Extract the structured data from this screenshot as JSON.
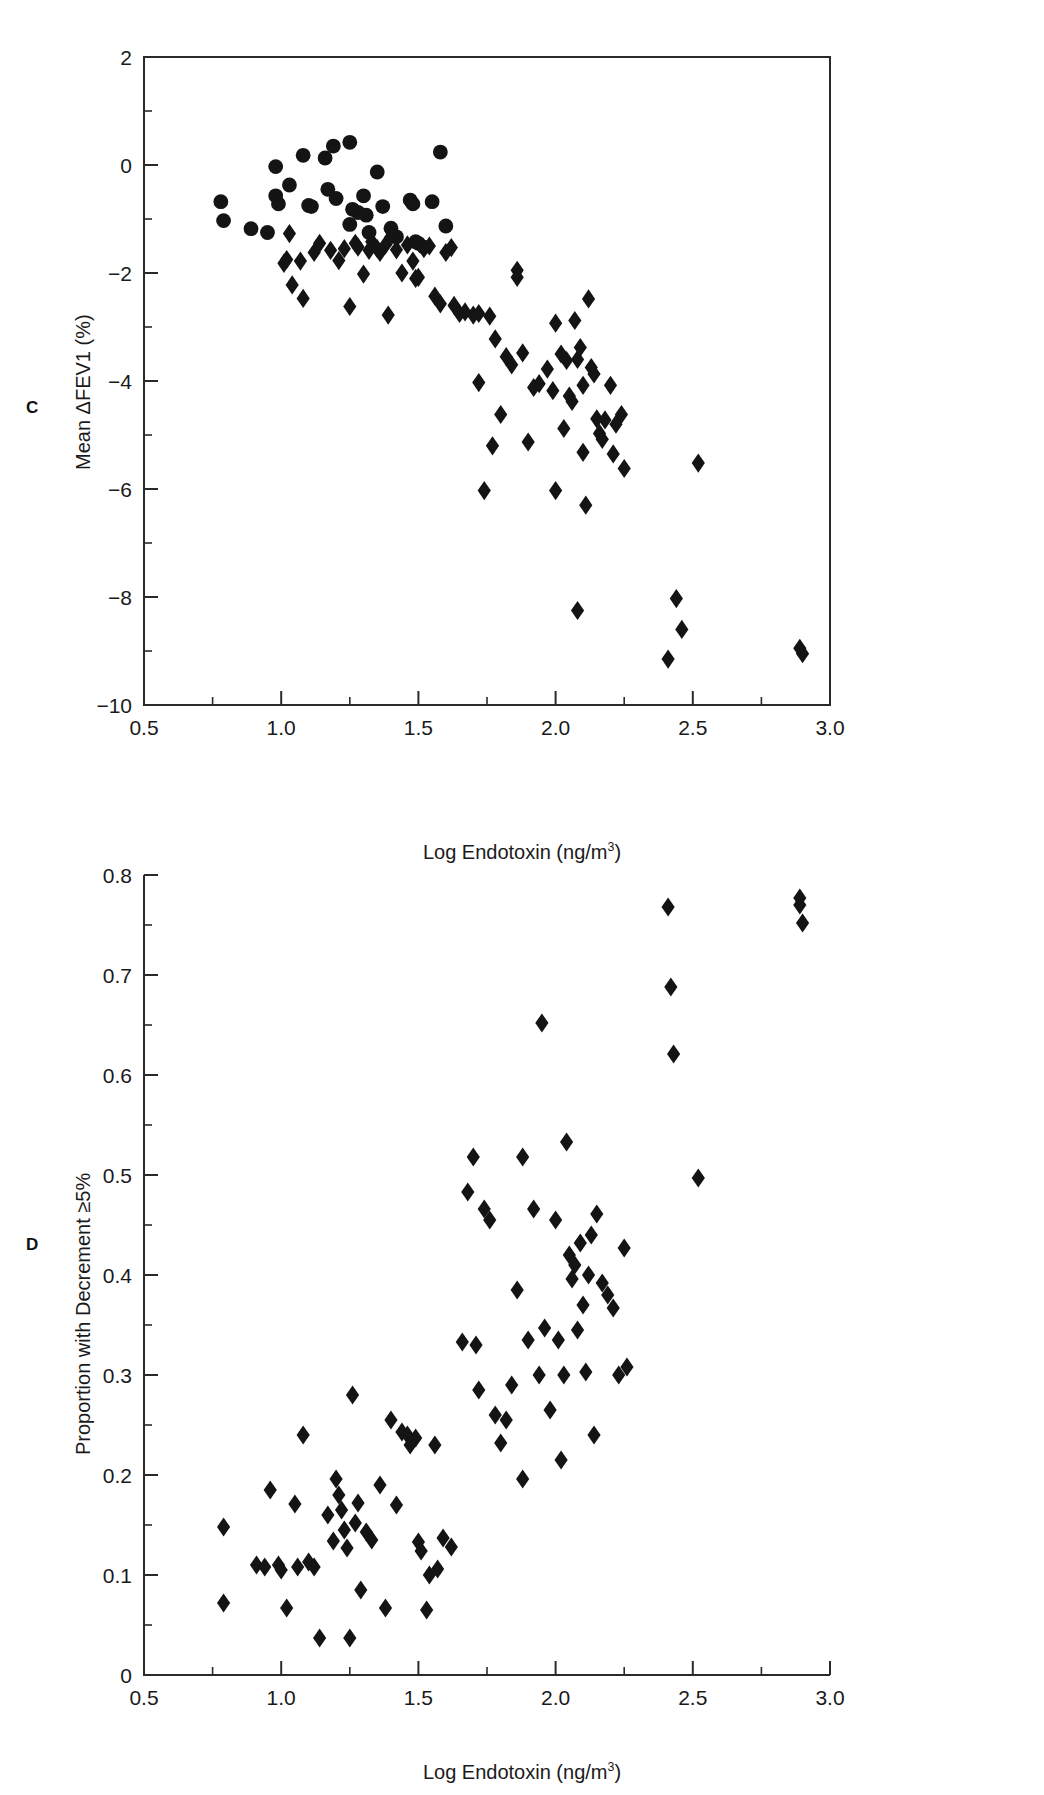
{
  "figure": {
    "background": "#ffffff",
    "marker_color": "#141414",
    "axis_color": "#2a2a2a"
  },
  "panel_c": {
    "letter": "C",
    "ylabel_text": "Mean ΔFEV1 (%)",
    "xlabel_prefix": "Log Endotoxin (ng/m",
    "xlabel_sup": "3",
    "xlabel_suffix": ")",
    "x_ticks": [
      "0.5",
      "1.0",
      "1.5",
      "2.0",
      "2.5",
      "3.0"
    ],
    "y_ticks": [
      "2",
      "0",
      "−2",
      "−4",
      "−6",
      "−8",
      "−10"
    ]
  },
  "panel_d": {
    "letter": "D",
    "ylabel_text": "Proportion with Decrement ≥5%",
    "xlabel_prefix": "Log Endotoxin (ng/m",
    "xlabel_sup": "3",
    "xlabel_suffix": ")",
    "x_ticks": [
      "0.5",
      "1.0",
      "1.5",
      "2.0",
      "2.5",
      "3.0"
    ],
    "y_ticks": [
      "0.8",
      "0.7",
      "0.6",
      "0.5",
      "0.4",
      "0.3",
      "0.2",
      "0.1",
      "0"
    ]
  },
  "chart_data": [
    {
      "type": "scatter",
      "panel": "C",
      "title": "",
      "xlabel": "Log Endotoxin (ng/m3)",
      "ylabel": "Mean ΔFEV1 (%)",
      "xlim": [
        0.5,
        3.0
      ],
      "ylim": [
        -10,
        2
      ],
      "x_major_step": 0.5,
      "x_minor_step": 0.25,
      "y_major_step": 2,
      "y_minor_step": 1,
      "grid": false,
      "legend": "none",
      "series": [
        {
          "name": "circles",
          "marker": "circle",
          "points": [
            [
              0.78,
              -0.68
            ],
            [
              0.79,
              -1.03
            ],
            [
              0.89,
              -1.18
            ],
            [
              0.95,
              -1.25
            ],
            [
              0.98,
              -0.03
            ],
            [
              0.98,
              -0.57
            ],
            [
              0.99,
              -0.72
            ],
            [
              1.03,
              -0.37
            ],
            [
              1.08,
              0.18
            ],
            [
              1.1,
              -0.75
            ],
            [
              1.11,
              -0.77
            ],
            [
              1.16,
              0.13
            ],
            [
              1.17,
              -0.45
            ],
            [
              1.19,
              0.35
            ],
            [
              1.2,
              -0.62
            ],
            [
              1.25,
              0.42
            ],
            [
              1.25,
              -1.1
            ],
            [
              1.26,
              -0.82
            ],
            [
              1.28,
              -0.88
            ],
            [
              1.3,
              -0.57
            ],
            [
              1.31,
              -0.93
            ],
            [
              1.32,
              -1.25
            ],
            [
              1.35,
              -0.13
            ],
            [
              1.37,
              -0.77
            ],
            [
              1.4,
              -1.17
            ],
            [
              1.42,
              -1.33
            ],
            [
              1.47,
              -0.65
            ],
            [
              1.48,
              -0.72
            ],
            [
              1.49,
              -1.42
            ],
            [
              1.5,
              -1.45
            ],
            [
              1.52,
              -1.52
            ],
            [
              1.55,
              -0.68
            ],
            [
              1.58,
              0.24
            ],
            [
              1.6,
              -1.13
            ]
          ]
        },
        {
          "name": "diamonds",
          "marker": "diamond",
          "points": [
            [
              1.03,
              -1.27
            ],
            [
              1.02,
              -1.75
            ],
            [
              1.01,
              -1.82
            ],
            [
              1.04,
              -2.22
            ],
            [
              1.07,
              -1.78
            ],
            [
              1.08,
              -2.47
            ],
            [
              1.12,
              -1.62
            ],
            [
              1.14,
              -1.45
            ],
            [
              1.18,
              -1.58
            ],
            [
              1.21,
              -1.77
            ],
            [
              1.23,
              -1.55
            ],
            [
              1.25,
              -2.62
            ],
            [
              1.27,
              -1.45
            ],
            [
              1.28,
              -1.52
            ],
            [
              1.3,
              -2.02
            ],
            [
              1.32,
              -1.58
            ],
            [
              1.33,
              -1.42
            ],
            [
              1.35,
              -1.55
            ],
            [
              1.36,
              -1.62
            ],
            [
              1.38,
              -1.48
            ],
            [
              1.39,
              -2.78
            ],
            [
              1.4,
              -1.33
            ],
            [
              1.42,
              -1.57
            ],
            [
              1.44,
              -2.0
            ],
            [
              1.46,
              -1.48
            ],
            [
              1.48,
              -1.78
            ],
            [
              1.49,
              -2.1
            ],
            [
              1.5,
              -2.08
            ],
            [
              1.52,
              -1.55
            ],
            [
              1.54,
              -1.5
            ],
            [
              1.56,
              -2.43
            ],
            [
              1.58,
              -2.57
            ],
            [
              1.6,
              -1.62
            ],
            [
              1.62,
              -1.53
            ],
            [
              1.63,
              -2.6
            ],
            [
              1.65,
              -2.75
            ],
            [
              1.67,
              -2.72
            ],
            [
              1.7,
              -2.78
            ],
            [
              1.72,
              -2.75
            ],
            [
              1.72,
              -4.03
            ],
            [
              1.74,
              -6.03
            ],
            [
              1.76,
              -2.8
            ],
            [
              1.77,
              -5.2
            ],
            [
              1.78,
              -3.22
            ],
            [
              1.8,
              -4.62
            ],
            [
              1.82,
              -3.55
            ],
            [
              1.84,
              -3.7
            ],
            [
              1.86,
              -1.95
            ],
            [
              1.86,
              -2.08
            ],
            [
              1.88,
              -3.48
            ],
            [
              1.9,
              -5.13
            ],
            [
              1.92,
              -4.12
            ],
            [
              1.94,
              -4.05
            ],
            [
              1.97,
              -3.78
            ],
            [
              1.99,
              -4.18
            ],
            [
              2.0,
              -2.93
            ],
            [
              2.0,
              -6.03
            ],
            [
              2.02,
              -3.5
            ],
            [
              2.03,
              -4.88
            ],
            [
              2.04,
              -3.62
            ],
            [
              2.05,
              -4.28
            ],
            [
              2.06,
              -4.38
            ],
            [
              2.07,
              -2.88
            ],
            [
              2.08,
              -3.6
            ],
            [
              2.09,
              -3.38
            ],
            [
              2.1,
              -4.08
            ],
            [
              2.1,
              -5.32
            ],
            [
              2.11,
              -6.3
            ],
            [
              2.12,
              -2.48
            ],
            [
              2.13,
              -3.75
            ],
            [
              2.14,
              -3.87
            ],
            [
              2.15,
              -4.7
            ],
            [
              2.16,
              -4.97
            ],
            [
              2.17,
              -5.08
            ],
            [
              2.18,
              -4.72
            ],
            [
              2.2,
              -4.08
            ],
            [
              2.21,
              -5.35
            ],
            [
              2.22,
              -4.8
            ],
            [
              2.24,
              -4.62
            ],
            [
              2.25,
              -5.62
            ],
            [
              2.08,
              -8.25
            ],
            [
              2.41,
              -9.15
            ],
            [
              2.44,
              -8.03
            ],
            [
              2.46,
              -8.6
            ],
            [
              2.52,
              -5.52
            ],
            [
              2.89,
              -8.95
            ],
            [
              2.9,
              -9.05
            ]
          ]
        }
      ]
    },
    {
      "type": "scatter",
      "panel": "D",
      "title": "",
      "xlabel": "Log Endotoxin (ng/m3)",
      "ylabel": "Proportion with Decrement ≥5%",
      "xlim": [
        0.5,
        3.0
      ],
      "ylim": [
        0,
        0.8
      ],
      "x_major_step": 0.5,
      "x_minor_step": 0.25,
      "y_major_step": 0.1,
      "y_minor_step": 0.05,
      "grid": false,
      "legend": "none",
      "series": [
        {
          "name": "diamonds",
          "marker": "diamond",
          "points": [
            [
              0.79,
              0.148
            ],
            [
              0.79,
              0.072
            ],
            [
              0.91,
              0.11
            ],
            [
              0.94,
              0.108
            ],
            [
              0.96,
              0.185
            ],
            [
              0.99,
              0.11
            ],
            [
              1.0,
              0.105
            ],
            [
              1.02,
              0.067
            ],
            [
              1.05,
              0.171
            ],
            [
              1.06,
              0.108
            ],
            [
              1.08,
              0.24
            ],
            [
              1.1,
              0.113
            ],
            [
              1.12,
              0.108
            ],
            [
              1.14,
              0.037
            ],
            [
              1.17,
              0.16
            ],
            [
              1.19,
              0.134
            ],
            [
              1.2,
              0.196
            ],
            [
              1.21,
              0.18
            ],
            [
              1.22,
              0.165
            ],
            [
              1.23,
              0.145
            ],
            [
              1.24,
              0.127
            ],
            [
              1.25,
              0.037
            ],
            [
              1.26,
              0.28
            ],
            [
              1.27,
              0.152
            ],
            [
              1.28,
              0.172
            ],
            [
              1.29,
              0.085
            ],
            [
              1.31,
              0.143
            ],
            [
              1.33,
              0.135
            ],
            [
              1.36,
              0.19
            ],
            [
              1.38,
              0.067
            ],
            [
              1.4,
              0.255
            ],
            [
              1.42,
              0.17
            ],
            [
              1.44,
              0.243
            ],
            [
              1.46,
              0.24
            ],
            [
              1.47,
              0.23
            ],
            [
              1.49,
              0.237
            ],
            [
              1.5,
              0.133
            ],
            [
              1.51,
              0.124
            ],
            [
              1.53,
              0.065
            ],
            [
              1.54,
              0.1
            ],
            [
              1.56,
              0.23
            ],
            [
              1.57,
              0.106
            ],
            [
              1.59,
              0.137
            ],
            [
              1.62,
              0.128
            ],
            [
              1.66,
              0.333
            ],
            [
              1.68,
              0.483
            ],
            [
              1.7,
              0.518
            ],
            [
              1.71,
              0.33
            ],
            [
              1.72,
              0.285
            ],
            [
              1.74,
              0.466
            ],
            [
              1.76,
              0.455
            ],
            [
              1.78,
              0.26
            ],
            [
              1.8,
              0.232
            ],
            [
              1.82,
              0.255
            ],
            [
              1.84,
              0.29
            ],
            [
              1.86,
              0.385
            ],
            [
              1.88,
              0.196
            ],
            [
              1.88,
              0.518
            ],
            [
              1.9,
              0.335
            ],
            [
              1.92,
              0.466
            ],
            [
              1.94,
              0.3
            ],
            [
              1.96,
              0.347
            ],
            [
              1.98,
              0.265
            ],
            [
              2.0,
              0.455
            ],
            [
              2.01,
              0.335
            ],
            [
              2.02,
              0.215
            ],
            [
              2.03,
              0.3
            ],
            [
              2.04,
              0.533
            ],
            [
              2.05,
              0.42
            ],
            [
              2.06,
              0.396
            ],
            [
              2.07,
              0.41
            ],
            [
              2.08,
              0.345
            ],
            [
              2.09,
              0.432
            ],
            [
              2.1,
              0.37
            ],
            [
              2.11,
              0.303
            ],
            [
              2.12,
              0.4
            ],
            [
              2.13,
              0.44
            ],
            [
              2.14,
              0.24
            ],
            [
              2.15,
              0.461
            ],
            [
              2.17,
              0.392
            ],
            [
              2.19,
              0.38
            ],
            [
              2.21,
              0.367
            ],
            [
              2.23,
              0.3
            ],
            [
              2.25,
              0.427
            ],
            [
              2.26,
              0.308
            ],
            [
              1.95,
              0.652
            ],
            [
              2.41,
              0.768
            ],
            [
              2.42,
              0.688
            ],
            [
              2.43,
              0.621
            ],
            [
              2.52,
              0.497
            ],
            [
              2.89,
              0.777
            ],
            [
              2.89,
              0.77
            ],
            [
              2.9,
              0.752
            ]
          ]
        }
      ]
    }
  ]
}
